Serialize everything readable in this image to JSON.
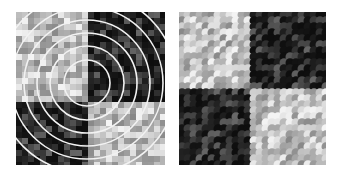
{
  "figure": {
    "panels": [
      {
        "id": "left",
        "description": "Noisy 2x2 checkerboard texture with concentric white circles overlay",
        "quadrants": {
          "top_left": "light",
          "top_right": "dark",
          "bottom_left": "dark",
          "bottom_right": "light"
        },
        "overlay": {
          "type": "concentric-circles",
          "color": "#ffffff",
          "center": [
            71,
            71
          ],
          "radii": [
            23,
            37,
            50,
            63,
            76,
            90
          ]
        }
      },
      {
        "id": "right",
        "description": "Smoothed noisy 2x2 checkerboard texture",
        "quadrants": {
          "top_left": "light",
          "top_right": "dark",
          "bottom_left": "dark",
          "bottom_right": "light"
        }
      }
    ],
    "colors": {
      "light": "#c4c4c4",
      "dark": "#0c0c0c",
      "ring": "#f2f2f2",
      "background": "#ffffff"
    }
  }
}
